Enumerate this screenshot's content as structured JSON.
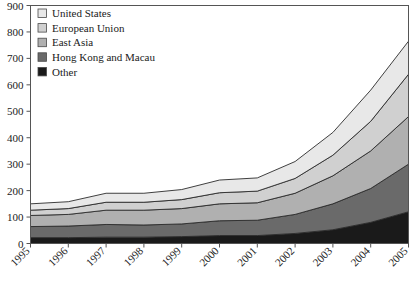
{
  "chart_data": {
    "type": "area",
    "stacked": true,
    "title": "",
    "subtitle": "",
    "xlabel": "",
    "ylabel": "",
    "categories": [
      "1995",
      "1996",
      "1997",
      "1998",
      "1999",
      "2000",
      "2001",
      "2002",
      "2003",
      "2004",
      "2005"
    ],
    "x": [
      1995,
      1996,
      1997,
      1998,
      1999,
      2000,
      2001,
      2002,
      2003,
      2004,
      2005
    ],
    "ylim": [
      0,
      900
    ],
    "xlim": [
      1995,
      2005
    ],
    "yticks": [
      0,
      100,
      200,
      300,
      400,
      500,
      600,
      700,
      800,
      900
    ],
    "ytick_labels": [
      "0",
      "100",
      "200",
      "300",
      "400",
      "500",
      "600",
      "700",
      "800",
      "900"
    ],
    "grid": false,
    "legend_position": "top-left",
    "xtick_rotation": 45,
    "series": [
      {
        "name": "Other",
        "color": "#1a1a1a",
        "values": [
          22,
          22,
          24,
          24,
          26,
          30,
          30,
          38,
          52,
          80,
          120
        ]
      },
      {
        "name": "Hong Kong and Macau",
        "color": "#6a6a6a",
        "values": [
          42,
          44,
          48,
          46,
          48,
          56,
          58,
          72,
          98,
          128,
          180
        ]
      },
      {
        "name": "East Asia",
        "color": "#b0b0b0",
        "values": [
          42,
          44,
          54,
          56,
          58,
          64,
          66,
          80,
          106,
          142,
          180
        ]
      },
      {
        "name": "European Union",
        "color": "#d0d0d0",
        "values": [
          20,
          22,
          30,
          30,
          34,
          42,
          44,
          56,
          78,
          112,
          160
        ]
      },
      {
        "name": "United States",
        "color": "#e8e8e8",
        "values": [
          24,
          26,
          34,
          34,
          38,
          48,
          50,
          64,
          86,
          118,
          125
        ]
      }
    ],
    "series_order_bottom_to_top": [
      "Other",
      "Hong Kong and Macau",
      "East Asia",
      "European Union",
      "United States"
    ],
    "legend_order_top_to_bottom": [
      "United States",
      "European Union",
      "East Asia",
      "Hong Kong and Macau",
      "Other"
    ],
    "totals": [
      150,
      158,
      190,
      190,
      204,
      240,
      248,
      310,
      420,
      580,
      765
    ]
  },
  "legend": {
    "items": [
      {
        "label": "United States",
        "color": "#e8e8e8"
      },
      {
        "label": "European Union",
        "color": "#d0d0d0"
      },
      {
        "label": "East Asia",
        "color": "#b0b0b0"
      },
      {
        "label": "Hong Kong and Macau",
        "color": "#6a6a6a"
      },
      {
        "label": "Other",
        "color": "#1a1a1a"
      }
    ]
  }
}
